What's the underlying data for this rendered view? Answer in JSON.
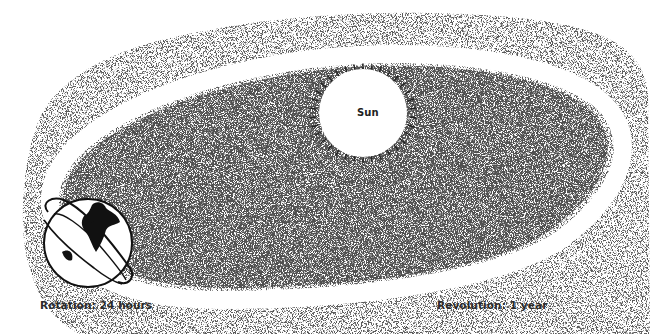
{
  "diagram": {
    "sun": {
      "label": "Sun"
    },
    "earth": {
      "icon": "globe-icon"
    },
    "labels": {
      "rotation": "Rotation: 24 hours",
      "revolution": "Revolution: 1 year"
    },
    "colors": {
      "background": "#ffffff",
      "stipple": "#1a1a1a",
      "orbit": "#ffffff",
      "text": "#2a2a2a"
    }
  }
}
